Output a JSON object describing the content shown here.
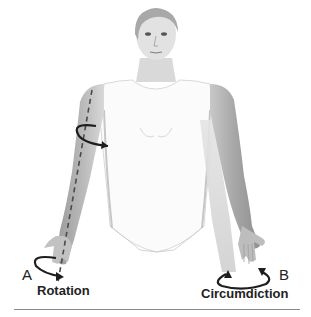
{
  "figure": {
    "panels": [
      {
        "letter": "A",
        "caption": "Rotation",
        "side": "left"
      },
      {
        "letter": "B",
        "caption": "Circumdiction",
        "side": "right"
      }
    ]
  },
  "colors": {
    "background": "#ffffff",
    "skin_light": "#e6e6e6",
    "skin_mid": "#bdbdbd",
    "skin_dark": "#8f8f8f",
    "hair": "#a8a8a8",
    "garment": "#fafafa",
    "arrow": "#1e1e1e",
    "axis_dash": "#4a4a4a",
    "rule": "#8a8a8a"
  }
}
